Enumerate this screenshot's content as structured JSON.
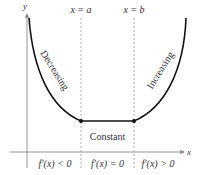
{
  "diagram": {
    "axes": {
      "x_label": "x",
      "y_label": "y"
    },
    "vertical_lines": [
      {
        "label": "x = a"
      },
      {
        "label": "x = b"
      }
    ],
    "curve_labels": {
      "left": "Decreasing",
      "middle": "Constant",
      "right": "Increasing"
    },
    "region_labels": [
      "f′(x) < 0",
      "f′(x) = 0",
      "f′(x) > 0"
    ],
    "colors": {
      "curve": "#111111",
      "axes": "#888888",
      "dashed": "#999999",
      "text": "#333333"
    }
  }
}
